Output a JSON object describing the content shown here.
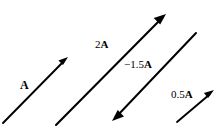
{
  "figure": {
    "background_color": "#ffffff",
    "stroke_color": "#000000",
    "width": 223,
    "height": 135
  },
  "vectors": [
    {
      "id": "vector-a",
      "label_magnitude": "",
      "label_symbol": "A",
      "label_full": "A",
      "scalar": 1,
      "direction": "up-right",
      "x1": 3,
      "y1": 123,
      "x2": 68,
      "y2": 57,
      "arrow_at": "head"
    },
    {
      "id": "vector-2a",
      "label_magnitude": "2",
      "label_symbol": "A",
      "label_full": "2 A",
      "scalar": 2,
      "direction": "up-right",
      "x1": 56,
      "y1": 125,
      "x2": 166,
      "y2": 14,
      "arrow_at": "head"
    },
    {
      "id": "vector-neg15a",
      "label_magnitude": "−1.5",
      "label_symbol": "A",
      "label_full": "−1.5 A",
      "scalar": -1.5,
      "direction": "down-left",
      "x1": 196,
      "y1": 33,
      "x2": 112,
      "y2": 121,
      "arrow_at": "head"
    },
    {
      "id": "vector-05a",
      "label_magnitude": "0.5",
      "label_symbol": "A",
      "label_full": "0.5 A",
      "scalar": 0.5,
      "direction": "up-right",
      "x1": 177,
      "y1": 122,
      "x2": 214,
      "y2": 90,
      "arrow_at": "head"
    }
  ],
  "labels": {
    "a": {
      "magnitude": "",
      "symbol": "A"
    },
    "two_a": {
      "magnitude": "2",
      "symbol": "A"
    },
    "neg_one_point_five_a": {
      "magnitude": "−1.5",
      "symbol": "A"
    },
    "half_a": {
      "magnitude": "0.5",
      "symbol": "A"
    }
  }
}
